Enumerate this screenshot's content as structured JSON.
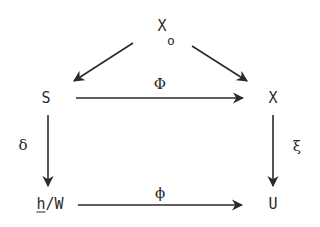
{
  "diagram": {
    "type": "commutative-diagram",
    "nodes": [
      {
        "id": "X0",
        "label": "X",
        "subscript": "o",
        "x": 162,
        "y": 28
      },
      {
        "id": "S",
        "label": "S",
        "x": 46,
        "y": 98
      },
      {
        "id": "X",
        "label": "X",
        "x": 273,
        "y": 98
      },
      {
        "id": "hW_h",
        "label": "h",
        "underline": true
      },
      {
        "id": "hW",
        "label": "h/W",
        "rest": "/W",
        "x": 50,
        "y": 204
      },
      {
        "id": "U",
        "label": "U",
        "x": 273,
        "y": 204
      }
    ],
    "edges": [
      {
        "from": "X0",
        "to": "S",
        "label": ""
      },
      {
        "from": "X0",
        "to": "X",
        "label": ""
      },
      {
        "from": "S",
        "to": "X",
        "label": "Φ"
      },
      {
        "from": "S",
        "to": "hW",
        "label": "δ"
      },
      {
        "from": "X",
        "to": "U",
        "label": "ξ"
      },
      {
        "from": "hW",
        "to": "U",
        "label": "ϕ"
      }
    ],
    "labels": {
      "x0_main": "X",
      "x0_sub": "o",
      "s": "S",
      "x": "X",
      "hw_h": "h",
      "hw_rest": "/W",
      "u": "U",
      "phi_top": "Φ",
      "delta": "δ",
      "xi": "ξ",
      "phi_bottom": "ϕ"
    },
    "colors": {
      "ink": "#2a2a2a",
      "background": "#ffffff"
    }
  }
}
